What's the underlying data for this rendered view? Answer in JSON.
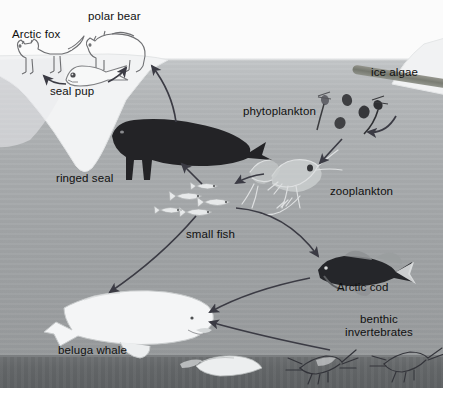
{
  "diagram": {
    "type": "food-web",
    "background": {
      "sky_color": "#fbfbfb",
      "water_top_color": "#c3c6c8",
      "water_bottom_color": "#96999b",
      "seafloor_color": "#65686a",
      "arrow_color": "#3b3b44",
      "label_color": "#101010"
    },
    "labels": [
      {
        "id": "arctic-fox",
        "text": "Arctic fox",
        "x": 12,
        "y": 28,
        "align": "left"
      },
      {
        "id": "polar-bear",
        "text": "polar bear",
        "x": 88,
        "y": 10,
        "align": "left"
      },
      {
        "id": "seal-pup",
        "text": "seal pup",
        "x": 50,
        "y": 85,
        "align": "left"
      },
      {
        "id": "ringed-seal",
        "text": "ringed seal",
        "x": 56,
        "y": 172,
        "align": "left"
      },
      {
        "id": "phytoplankton",
        "text": "phytoplankton",
        "x": 243,
        "y": 105,
        "align": "left"
      },
      {
        "id": "ice-algae",
        "text": "ice algae",
        "x": 371,
        "y": 66,
        "align": "left"
      },
      {
        "id": "zooplankton",
        "text": "zooplankton",
        "x": 330,
        "y": 185,
        "align": "left"
      },
      {
        "id": "small-fish",
        "text": "small fish",
        "x": 186,
        "y": 228,
        "align": "left"
      },
      {
        "id": "arctic-cod",
        "text": "Arctic cod",
        "x": 337,
        "y": 281,
        "align": "left"
      },
      {
        "id": "benthic-invertebrates",
        "text": "benthic\ninvertebrates",
        "x": 345,
        "y": 313,
        "align": "left"
      },
      {
        "id": "beluga-whale",
        "text": "beluga whale",
        "x": 58,
        "y": 344,
        "align": "left"
      }
    ],
    "organisms": [
      {
        "id": "arctic-fox",
        "name": "Arctic fox",
        "habitat": "ice-surface",
        "style": "line-drawing"
      },
      {
        "id": "polar-bear",
        "name": "polar bear",
        "habitat": "ice-surface",
        "style": "line-drawing"
      },
      {
        "id": "seal-pup",
        "name": "seal pup",
        "habitat": "ice-surface",
        "style": "line-drawing"
      },
      {
        "id": "ringed-seal",
        "name": "ringed seal",
        "habitat": "water-column",
        "style": "dark-silhouette"
      },
      {
        "id": "phytoplankton",
        "name": "phytoplankton",
        "habitat": "water-column",
        "style": "dark-specks"
      },
      {
        "id": "ice-algae",
        "name": "ice algae",
        "habitat": "under-ice",
        "style": "dark-band"
      },
      {
        "id": "zooplankton",
        "name": "zooplankton",
        "habitat": "water-column",
        "style": "pale-copepods"
      },
      {
        "id": "small-fish",
        "name": "small fish",
        "habitat": "water-column",
        "style": "pale-school"
      },
      {
        "id": "arctic-cod",
        "name": "Arctic cod",
        "habitat": "water-column",
        "style": "dark-fish"
      },
      {
        "id": "benthic-invertebrates",
        "name": "benthic invertebrates",
        "habitat": "seafloor",
        "style": "pale-shrimp-clam"
      },
      {
        "id": "beluga-whale",
        "name": "beluga whale",
        "habitat": "water-column",
        "style": "white-whale"
      }
    ],
    "energy_flows": [
      {
        "from": "seal-pup",
        "to": "arctic-fox"
      },
      {
        "from": "seal-pup",
        "to": "polar-bear"
      },
      {
        "from": "ringed-seal",
        "to": "polar-bear"
      },
      {
        "from": "small-fish",
        "to": "ringed-seal"
      },
      {
        "from": "zooplankton",
        "to": "small-fish"
      },
      {
        "from": "phytoplankton",
        "to": "zooplankton"
      },
      {
        "from": "ice-algae",
        "to": "phytoplankton"
      },
      {
        "from": "small-fish",
        "to": "beluga-whale"
      },
      {
        "from": "small-fish",
        "to": "arctic-cod"
      },
      {
        "from": "arctic-cod",
        "to": "beluga-whale"
      },
      {
        "from": "benthic-invertebrates",
        "to": "beluga-whale"
      }
    ]
  }
}
